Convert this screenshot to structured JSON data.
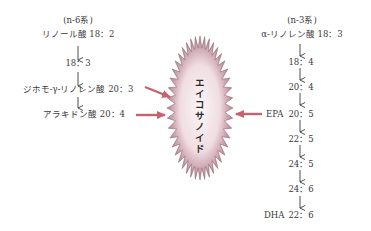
{
  "colors": {
    "arrow_accent": "#c9606f",
    "burst_center": "#f6eef0",
    "burst_edge": "#b57f8d",
    "text": "#3a3a3a"
  },
  "n6": {
    "header": "(n-6系)",
    "steps": [
      {
        "label": "リノール酸 18：2"
      },
      {
        "label": "18：3"
      },
      {
        "label": "ジホモ-γ-リノレン酸 20：3"
      },
      {
        "label": "アラキドン酸 20：4"
      }
    ]
  },
  "n3": {
    "header": "(n-3系)",
    "steps": [
      {
        "label": "α-リノレン酸 18：3"
      },
      {
        "label": "18：4"
      },
      {
        "label": "20：4"
      },
      {
        "prefix": "EPA",
        "label": "20：5"
      },
      {
        "label": "22：5"
      },
      {
        "label": "24：5"
      },
      {
        "label": "24：6"
      },
      {
        "prefix": "DHA",
        "label": "22：6"
      }
    ]
  },
  "center": {
    "label": "エイコサノイド",
    "icon": "starburst-icon"
  }
}
